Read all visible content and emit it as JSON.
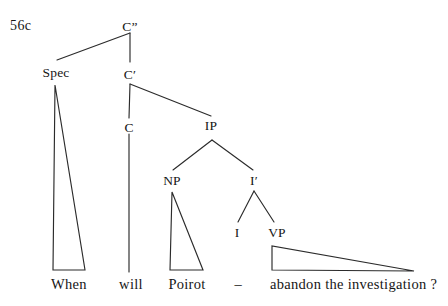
{
  "figure": {
    "example_number": "56c",
    "type": "syntactic-tree-diagram",
    "line_color": "#2b2b2b",
    "text_color": "#161616",
    "background_color": "#ffffff"
  },
  "nodes": {
    "cp": "C”",
    "spec": "Spec",
    "cbar": "C′",
    "c": "C",
    "ip": "IP",
    "np": "NP",
    "ibar": "I′",
    "i": "I",
    "vp": "VP"
  },
  "leaves": {
    "when": "When",
    "will": "will",
    "poirot": "Poirot",
    "trace": "–",
    "vp_string": "abandon the investigation ?"
  },
  "sentence": "When will Poirot – abandon the investigation ?"
}
